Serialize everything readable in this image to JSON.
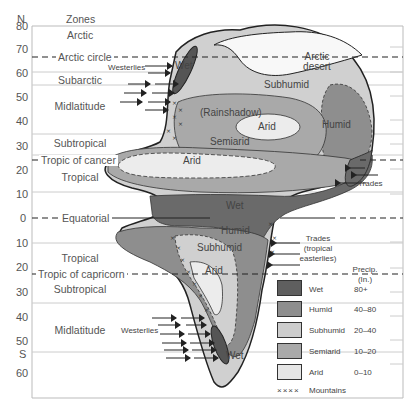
{
  "axis": {
    "north_label": "N",
    "south_label": "S",
    "header": "Zones",
    "ticks_north": [
      "80",
      "70",
      "60",
      "50",
      "40",
      "30",
      "20",
      "10"
    ],
    "tick_equator": "0",
    "ticks_south": [
      "10",
      "20",
      "30",
      "40",
      "50",
      "60"
    ]
  },
  "zones": [
    "Arctic",
    "Subarctic",
    "Midlatitude",
    "Subtropical",
    "Tropical",
    "Tropical",
    "Subtropical",
    "Midlatitude"
  ],
  "lines": {
    "arctic_circle": "Arctic circle",
    "tropic_cancer": "Tropic of cancer",
    "equator": "Equatorial",
    "tropic_capricorn": "Tropic of capricorn"
  },
  "regions": {
    "arctic_desert": [
      "Arctic",
      "desert"
    ],
    "subhumid_n": "Subhumid",
    "humid_n": "Humid",
    "rainshadow": "(Rainshadow)",
    "arid_n_inner": "Arid",
    "semiarid_n": "Semiarid",
    "arid_n_large": "Arid",
    "wet_eq": "Wet",
    "humid_s": "Humid",
    "subhumid_s": "Subhumid",
    "arid_s": "Arid",
    "wet_nw": "Wet",
    "wet_sw": "Wet"
  },
  "winds": {
    "westerlies_n": "Westerlies",
    "westerlies_s": "Westerlies",
    "trades_n": "Trades",
    "trades_s": [
      "Trades",
      "(tropical",
      "easterlies)"
    ]
  },
  "legend": {
    "header": [
      "Precip.",
      "(In.)"
    ],
    "items": [
      {
        "label": "Wet",
        "range": "80+",
        "color": "#5f5f5f"
      },
      {
        "label": "Humid",
        "range": "40–80",
        "color": "#8e8e8e"
      },
      {
        "label": "Subhumid",
        "range": "20–40",
        "color": "#cdcdcd"
      },
      {
        "label": "Semiarid",
        "range": "10–20",
        "color": "#a9a9a9"
      },
      {
        "label": "Arid",
        "range": "0–10",
        "color": "#e6e6e6"
      }
    ],
    "mountains_symbol": "××××",
    "mountains_label": "Mountains"
  }
}
